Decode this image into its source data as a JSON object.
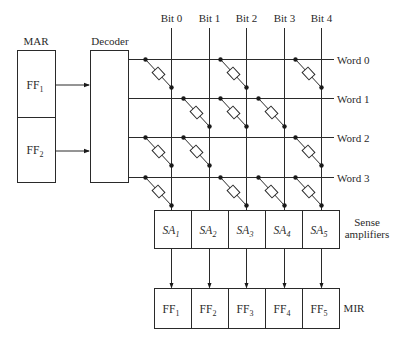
{
  "mar": {
    "label": "MAR",
    "cells": [
      {
        "main": "FF",
        "sub": "1"
      },
      {
        "main": "FF",
        "sub": "2"
      }
    ]
  },
  "decoder": {
    "label": "Decoder"
  },
  "bits": [
    "Bit 0",
    "Bit 1",
    "Bit 2",
    "Bit 3",
    "Bit 4"
  ],
  "words": [
    "Word 0",
    "Word 1",
    "Word 2",
    "Word 3"
  ],
  "diode_matrix": [
    [
      1,
      0,
      1,
      0,
      1
    ],
    [
      0,
      1,
      1,
      1,
      0
    ],
    [
      1,
      1,
      0,
      0,
      1
    ],
    [
      1,
      0,
      1,
      1,
      1
    ]
  ],
  "sense_amplifiers": {
    "label_line1": "Sense",
    "label_line2": "amplifiers",
    "cells": [
      {
        "main": "SA",
        "sub": "1"
      },
      {
        "main": "SA",
        "sub": "2"
      },
      {
        "main": "SA",
        "sub": "3"
      },
      {
        "main": "SA",
        "sub": "4"
      },
      {
        "main": "SA",
        "sub": "5"
      }
    ]
  },
  "mir": {
    "label": "MIR",
    "cells": [
      {
        "main": "FF",
        "sub": "1"
      },
      {
        "main": "FF",
        "sub": "2"
      },
      {
        "main": "FF",
        "sub": "3"
      },
      {
        "main": "FF",
        "sub": "4"
      },
      {
        "main": "FF",
        "sub": "5"
      }
    ]
  }
}
